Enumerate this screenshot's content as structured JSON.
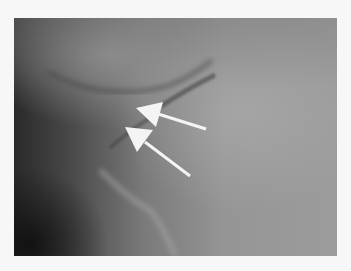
{
  "image": {
    "description": "Grayscale medical radiograph with two white arrows pointing to a thin dark curved line",
    "background_color": "#f7f7f7",
    "arrows": [
      {
        "id": "arrow-upper",
        "tip": [
          136,
          106
        ],
        "tail": [
          206,
          129
        ],
        "color": "#ffffff"
      },
      {
        "id": "arrow-lower",
        "tip": [
          125,
          126
        ],
        "tail": [
          190,
          176
        ],
        "color": "#ffffff"
      }
    ]
  }
}
